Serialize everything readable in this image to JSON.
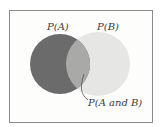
{
  "diagram": {
    "type": "venn",
    "labels": {
      "a": "P(A)",
      "b": "P(B)",
      "intersection": "P(A and B)"
    },
    "colors": {
      "a": "#6b6b6b",
      "b": "#e6e6e4",
      "intersection": "#a9a9a7",
      "frame": "#8a8a8a"
    }
  }
}
